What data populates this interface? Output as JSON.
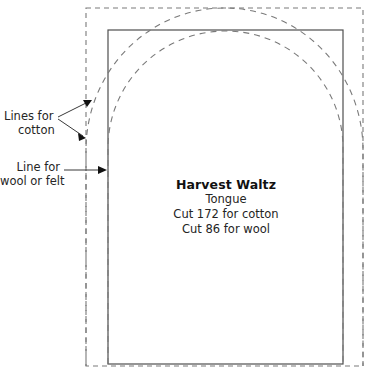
{
  "document": {
    "type": "sewing-pattern-template",
    "background_color": "#ffffff"
  },
  "piece": {
    "title": "Harvest Waltz",
    "part": "Tongue",
    "cut_cotton": "Cut 172 for cotton",
    "cut_wool": "Cut 86 for wool"
  },
  "annotations": {
    "cotton": {
      "line1": "Lines for",
      "line2": "cotton"
    },
    "wool": {
      "line1": "Line for",
      "line2": "wool or felt"
    }
  },
  "lines": {
    "solid_color": "#555555",
    "dashed_color": "#777777",
    "leader_color": "#222222",
    "dash_pattern": "5,4"
  }
}
